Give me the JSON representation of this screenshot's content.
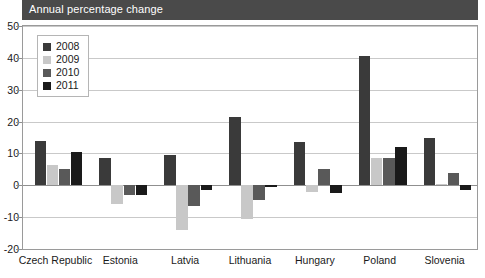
{
  "title": "Annual percentage change",
  "chart_data": {
    "type": "bar",
    "title": "Annual percentage change",
    "xlabel": "",
    "ylabel": "",
    "ylim": [
      -20,
      50
    ],
    "yticks": [
      50,
      40,
      30,
      20,
      10,
      0,
      -10,
      -20
    ],
    "grid": true,
    "legend_position": "top-left",
    "categories": [
      "Czech Republic",
      "Estonia",
      "Latvia",
      "Lithuania",
      "Hungary",
      "Poland",
      "Slovenia"
    ],
    "series": [
      {
        "name": "2008",
        "color": "#3a3a3a",
        "values": [
          14,
          8.5,
          9.5,
          21.5,
          13.5,
          40.5,
          15
        ]
      },
      {
        "name": "2009",
        "color": "#c8c8c8",
        "values": [
          6.5,
          -6,
          -14,
          -10.5,
          -2,
          8.5,
          0.5
        ]
      },
      {
        "name": "2010",
        "color": "#595959",
        "values": [
          5,
          -3,
          -6.5,
          -4.5,
          5,
          8.5,
          4
        ]
      },
      {
        "name": "2011",
        "color": "#1a1a1a",
        "values": [
          10.5,
          -3,
          -1.5,
          -0.5,
          -2.5,
          12,
          -1.5
        ]
      }
    ]
  }
}
